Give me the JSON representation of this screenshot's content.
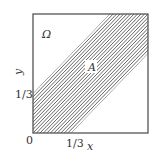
{
  "diagram": {
    "region_label": "Ω",
    "set_label": "A",
    "x_axis_label": "x",
    "y_axis_label": "y",
    "origin_label": "0",
    "x_tick_label": "1/3",
    "y_tick_label": "1/3",
    "band": {
      "lower_offset": -0.3333,
      "upper_offset": 0.3333,
      "description": "x - 1/3 ≤ y ≤ x + 1/3"
    },
    "domain": {
      "x": [
        0,
        1
      ],
      "y": [
        0,
        1
      ]
    },
    "hatch_count": 22,
    "colors": {
      "stroke": "#555555",
      "hatch": "#555555",
      "text": "#333333"
    }
  }
}
